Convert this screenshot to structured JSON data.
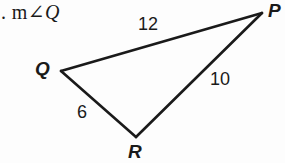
{
  "figure": {
    "background_color": "#fdfdfd",
    "stroke_color": "#1a1a1a",
    "text_color": "#1a1a1a",
    "width": 285,
    "height": 163
  },
  "problem": {
    "prefix": ".",
    "measure_text": " m",
    "angle_symbol": "∠",
    "angle_vertex": "Q",
    "full_text": ". m∠Q"
  },
  "triangle": {
    "name": "PQR",
    "vertices": [
      {
        "label": "P",
        "x": 262,
        "y": 13
      },
      {
        "label": "Q",
        "x": 61,
        "y": 71
      },
      {
        "label": "R",
        "x": 136,
        "y": 137
      }
    ],
    "sides": [
      {
        "name": "QP",
        "from": "Q",
        "to": "P",
        "length_label": "12"
      },
      {
        "name": "PR",
        "from": "P",
        "to": "R",
        "length_label": "10"
      },
      {
        "name": "QR",
        "from": "Q",
        "to": "R",
        "length_label": "6"
      }
    ],
    "labels": {
      "vertex_p": "P",
      "vertex_q": "Q",
      "vertex_r": "R",
      "side_qp": "12",
      "side_pr": "10",
      "side_qr": "6"
    }
  }
}
